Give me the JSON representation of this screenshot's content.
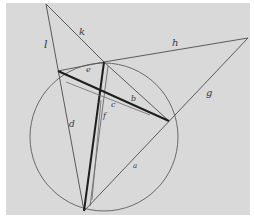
{
  "diagram": {
    "type": "hand-drawn geometric construction",
    "colors": {
      "paper": "#d9d9d9",
      "background": "#ffffff",
      "thin_line": "#5a5a5a",
      "thick_line": "#1e1e1e",
      "circle": "#6a6a6a"
    },
    "circle": {
      "cx": 104,
      "cy": 137,
      "r": 74
    },
    "points": {
      "T": [
        46,
        4
      ],
      "R": [
        248,
        38
      ],
      "A": [
        104,
        62
      ],
      "L": [
        58,
        71
      ],
      "B": [
        169,
        121
      ],
      "P": [
        84,
        211
      ]
    },
    "labels": {
      "k": "k",
      "h": "h",
      "l": "l",
      "g": "g",
      "e": "e",
      "f": "f",
      "b": "b",
      "c": "c",
      "d": "d",
      "a": "a"
    }
  }
}
